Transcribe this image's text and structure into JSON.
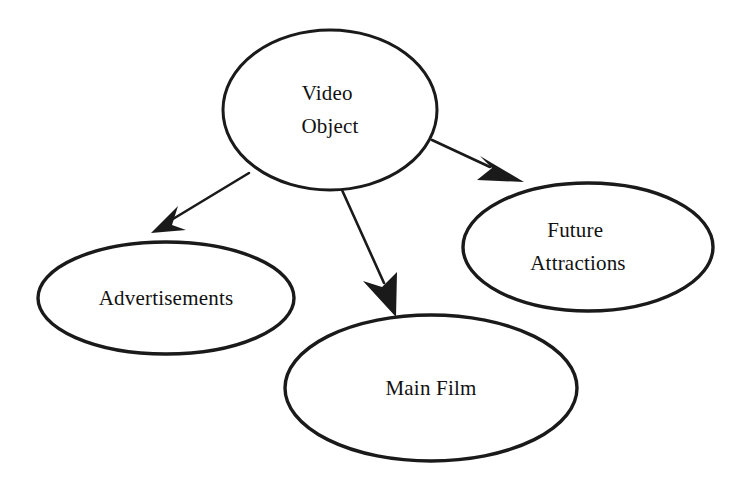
{
  "diagram": {
    "background_color": "#ffffff",
    "stroke_color": "#1a1a1a",
    "text_color": "#111111",
    "nodes": [
      {
        "id": "video-object",
        "label_lines": [
          "Video",
          "Object"
        ],
        "label": "Video Object",
        "cx": 330,
        "cy": 110,
        "rx": 107,
        "ry": 80,
        "stroke_width": 3.0,
        "font_size": 23
      },
      {
        "id": "advertisements",
        "label_lines": [
          "Advertisements"
        ],
        "label": "Advertisements",
        "cx": 166,
        "cy": 298,
        "rx": 128,
        "ry": 56,
        "stroke_width": 3.4,
        "font_size": 22
      },
      {
        "id": "main-film",
        "label_lines": [
          "Main Film"
        ],
        "label": "Main Film",
        "cx": 431,
        "cy": 388,
        "rx": 146,
        "ry": 73,
        "stroke_width": 3.4,
        "font_size": 22
      },
      {
        "id": "future-attractions",
        "label_lines": [
          "Future",
          "Attractions"
        ],
        "label": "Future Attractions",
        "cx": 588,
        "cy": 247,
        "rx": 125,
        "ry": 64,
        "stroke_width": 3.4,
        "font_size": 22
      }
    ],
    "edges": [
      {
        "id": "edge-video-object-to-advertisements",
        "from": "video-object",
        "to": "advertisements",
        "x1": 249,
        "y1": 173,
        "x2": 152,
        "y2": 232,
        "stroke_width": 2.6,
        "arrow": "filled-triangle"
      },
      {
        "id": "edge-video-object-to-main-film",
        "from": "video-object",
        "to": "main-film",
        "x1": 342,
        "y1": 190,
        "x2": 396,
        "y2": 316,
        "stroke_width": 2.6,
        "arrow": "filled-triangle"
      },
      {
        "id": "edge-video-object-to-future-attractions",
        "from": "video-object",
        "to": "future-attractions",
        "x1": 432,
        "y1": 140,
        "x2": 523,
        "y2": 182,
        "stroke_width": 2.6,
        "arrow": "filled-triangle"
      }
    ]
  }
}
